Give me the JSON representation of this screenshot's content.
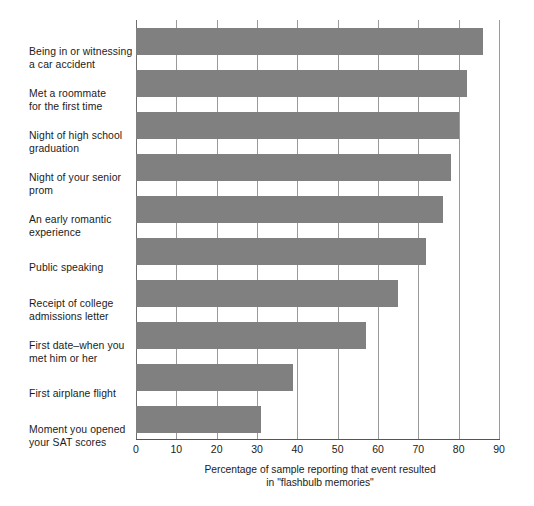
{
  "chart_data": {
    "type": "bar",
    "orientation": "horizontal",
    "title": "",
    "xlabel": "Percentage of sample reporting that event resulted in \"flashbulb memories\"",
    "xlabel_line1": "Percentage of sample reporting that event resulted",
    "xlabel_line2": "in \"flashbulb memories\"",
    "ylabel": "",
    "xlim": [
      0,
      90
    ],
    "xticks": [
      0,
      10,
      20,
      30,
      40,
      50,
      60,
      70,
      80,
      90
    ],
    "xtick_labels": [
      "0",
      "10",
      "20",
      "30",
      "40",
      "50",
      "60",
      "70",
      "80",
      "90"
    ],
    "grid": true,
    "legend": false,
    "bar_color": "#808080",
    "categories": [
      "Being in or witnessing\na car accident",
      "Met a roommate\nfor the first time",
      "Night of high school\ngraduation",
      "Night of your senior\nprom",
      "An early romantic\nexperience",
      "Public speaking",
      "Receipt of college\nadmissions letter",
      "First date–when you\nmet him or her",
      "First airplane flight",
      "Moment you opened\nyour SAT scores"
    ],
    "values": [
      86,
      82,
      80,
      78,
      76,
      72,
      65,
      57,
      39,
      31
    ]
  }
}
